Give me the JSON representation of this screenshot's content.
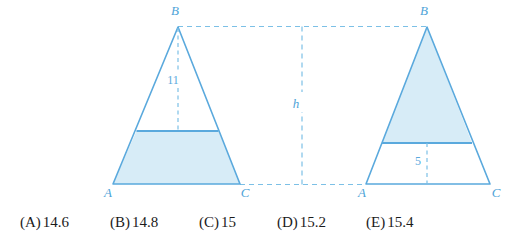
{
  "figure": {
    "left_triangle": {
      "vertex_labels": {
        "apex": "B",
        "bottom_left": "A",
        "bottom_right": "C"
      },
      "segment_label": "11",
      "shaded_region": "lower-trapezoid"
    },
    "right_triangle": {
      "vertex_labels": {
        "apex": "B",
        "bottom_left": "A",
        "bottom_right": "C"
      },
      "segment_label": "5",
      "shaded_region": "upper-triangle"
    },
    "height_label": "h"
  },
  "answers": {
    "options": [
      {
        "tag": "(A)",
        "value": "14.6"
      },
      {
        "tag": "(B)",
        "value": "14.8"
      },
      {
        "tag": "(C)",
        "value": "15"
      },
      {
        "tag": "(D)",
        "value": "15.2"
      },
      {
        "tag": "(E)",
        "value": "15.4"
      }
    ]
  },
  "colors": {
    "stroke": "#5aa9dd",
    "fill": "#d7ecf7",
    "dash": "#7cc0e6",
    "text": "#1b1b1b"
  }
}
